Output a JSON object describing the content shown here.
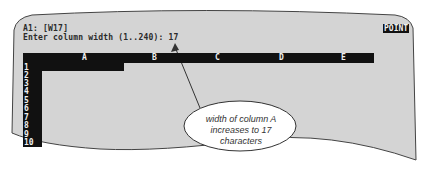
{
  "status": {
    "cell_line": "A1: [W17]",
    "prompt_line": "Enter column width (1..240): 17",
    "mode_indicator": "POINT"
  },
  "columns": [
    "A",
    "B",
    "C",
    "D",
    "E"
  ],
  "rows": [
    "1",
    "2",
    "3",
    "4",
    "5",
    "6",
    "7",
    "8",
    "9",
    "10"
  ],
  "callout": {
    "line1": "width of column A",
    "line2": "increases to 17",
    "line3": "characters"
  },
  "colors": {
    "screen_bg": "#d4d4d4",
    "highlight": "#111111",
    "page_bg": "#ffffff"
  }
}
